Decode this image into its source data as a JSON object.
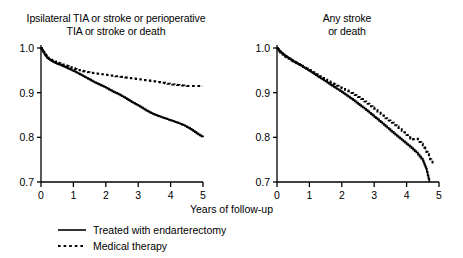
{
  "figure": {
    "xlabel": "Years of follow-up",
    "legend": [
      {
        "label": "Treated with endarterectomy",
        "style": "solid",
        "color": "#000000"
      },
      {
        "label": "Medical therapy",
        "style": "dashed",
        "color": "#000000"
      }
    ]
  },
  "chart_data": [
    {
      "type": "line",
      "panel": "left",
      "title": "Ipsilateral TIA or stroke or perioperative\nTIA or stroke or death",
      "xlabel": "Years of follow-up",
      "ylabel": "",
      "xlim": [
        0,
        5
      ],
      "ylim": [
        0.7,
        1.0
      ],
      "xticks": [
        0,
        1,
        2,
        3,
        4,
        5
      ],
      "xticklabels": [
        "0",
        "1",
        "2",
        "3",
        "4",
        "5"
      ],
      "yticks": [
        0.7,
        0.8,
        0.9,
        1.0
      ],
      "yticklabels": [
        "0.7",
        "0.8",
        "0.9",
        "1.0"
      ],
      "grid": false,
      "legend_position": "below-figure",
      "series": [
        {
          "name": "Treated with endarterectomy",
          "style": "solid",
          "color": "#000000",
          "x": [
            0,
            0.05,
            0.12,
            0.2,
            0.3,
            0.45,
            0.6,
            0.75,
            0.9,
            1.05,
            1.2,
            1.4,
            1.6,
            1.8,
            2.0,
            2.2,
            2.4,
            2.6,
            2.8,
            3.0,
            3.2,
            3.4,
            3.6,
            3.8,
            4.0,
            4.2,
            4.4,
            4.6,
            4.8,
            5.0
          ],
          "y": [
            1.0,
            0.995,
            0.985,
            0.978,
            0.972,
            0.966,
            0.962,
            0.957,
            0.952,
            0.947,
            0.941,
            0.933,
            0.925,
            0.918,
            0.911,
            0.903,
            0.896,
            0.888,
            0.879,
            0.871,
            0.862,
            0.854,
            0.848,
            0.843,
            0.838,
            0.833,
            0.827,
            0.819,
            0.809,
            0.8
          ]
        },
        {
          "name": "Medical therapy",
          "style": "dashed",
          "color": "#000000",
          "x": [
            0,
            0.1,
            0.2,
            0.35,
            0.5,
            0.7,
            0.9,
            1.1,
            1.3,
            1.5,
            1.7,
            1.9,
            2.1,
            2.3,
            2.5,
            2.7,
            3.0,
            3.3,
            3.6,
            3.9,
            4.2,
            4.5,
            4.8,
            5.0
          ],
          "y": [
            1.0,
            0.988,
            0.978,
            0.972,
            0.967,
            0.962,
            0.957,
            0.952,
            0.948,
            0.945,
            0.943,
            0.941,
            0.939,
            0.937,
            0.935,
            0.933,
            0.93,
            0.927,
            0.924,
            0.92,
            0.917,
            0.915,
            0.915,
            0.915
          ]
        }
      ]
    },
    {
      "type": "line",
      "panel": "right",
      "title": "Any stroke\nor death",
      "xlabel": "Years of follow-up",
      "ylabel": "",
      "xlim": [
        0,
        5
      ],
      "ylim": [
        0.7,
        1.0
      ],
      "xticks": [
        0,
        1,
        2,
        3,
        4,
        5
      ],
      "xticklabels": [
        "0",
        "1",
        "2",
        "3",
        "4",
        "5"
      ],
      "yticks": [
        0.7,
        0.8,
        0.9,
        1.0
      ],
      "yticklabels": [
        "0.7",
        "0.8",
        "0.9",
        "1.0"
      ],
      "grid": false,
      "legend_position": "below-figure",
      "series": [
        {
          "name": "Treated with endarterectomy",
          "style": "solid",
          "color": "#000000",
          "x": [
            0,
            0.08,
            0.2,
            0.35,
            0.5,
            0.7,
            0.9,
            1.1,
            1.3,
            1.5,
            1.7,
            1.9,
            2.1,
            2.3,
            2.5,
            2.7,
            2.9,
            3.1,
            3.3,
            3.5,
            3.7,
            3.9,
            4.1,
            4.3,
            4.5,
            4.6,
            4.7
          ],
          "y": [
            1.0,
            0.993,
            0.985,
            0.978,
            0.97,
            0.962,
            0.953,
            0.944,
            0.934,
            0.925,
            0.915,
            0.906,
            0.896,
            0.886,
            0.875,
            0.864,
            0.852,
            0.84,
            0.828,
            0.815,
            0.803,
            0.791,
            0.779,
            0.766,
            0.748,
            0.73,
            0.7
          ]
        },
        {
          "name": "Medical therapy",
          "style": "dashed",
          "color": "#000000",
          "x": [
            0,
            0.1,
            0.25,
            0.4,
            0.6,
            0.8,
            1.0,
            1.2,
            1.4,
            1.6,
            1.8,
            2.0,
            2.2,
            2.4,
            2.6,
            2.8,
            3.0,
            3.2,
            3.4,
            3.6,
            3.8,
            4.0,
            4.15,
            4.3,
            4.5,
            4.65,
            4.8
          ],
          "y": [
            1.0,
            0.99,
            0.981,
            0.974,
            0.966,
            0.958,
            0.95,
            0.941,
            0.933,
            0.925,
            0.917,
            0.91,
            0.903,
            0.895,
            0.886,
            0.875,
            0.864,
            0.852,
            0.84,
            0.83,
            0.818,
            0.805,
            0.795,
            0.797,
            0.782,
            0.762,
            0.74
          ]
        }
      ]
    }
  ]
}
